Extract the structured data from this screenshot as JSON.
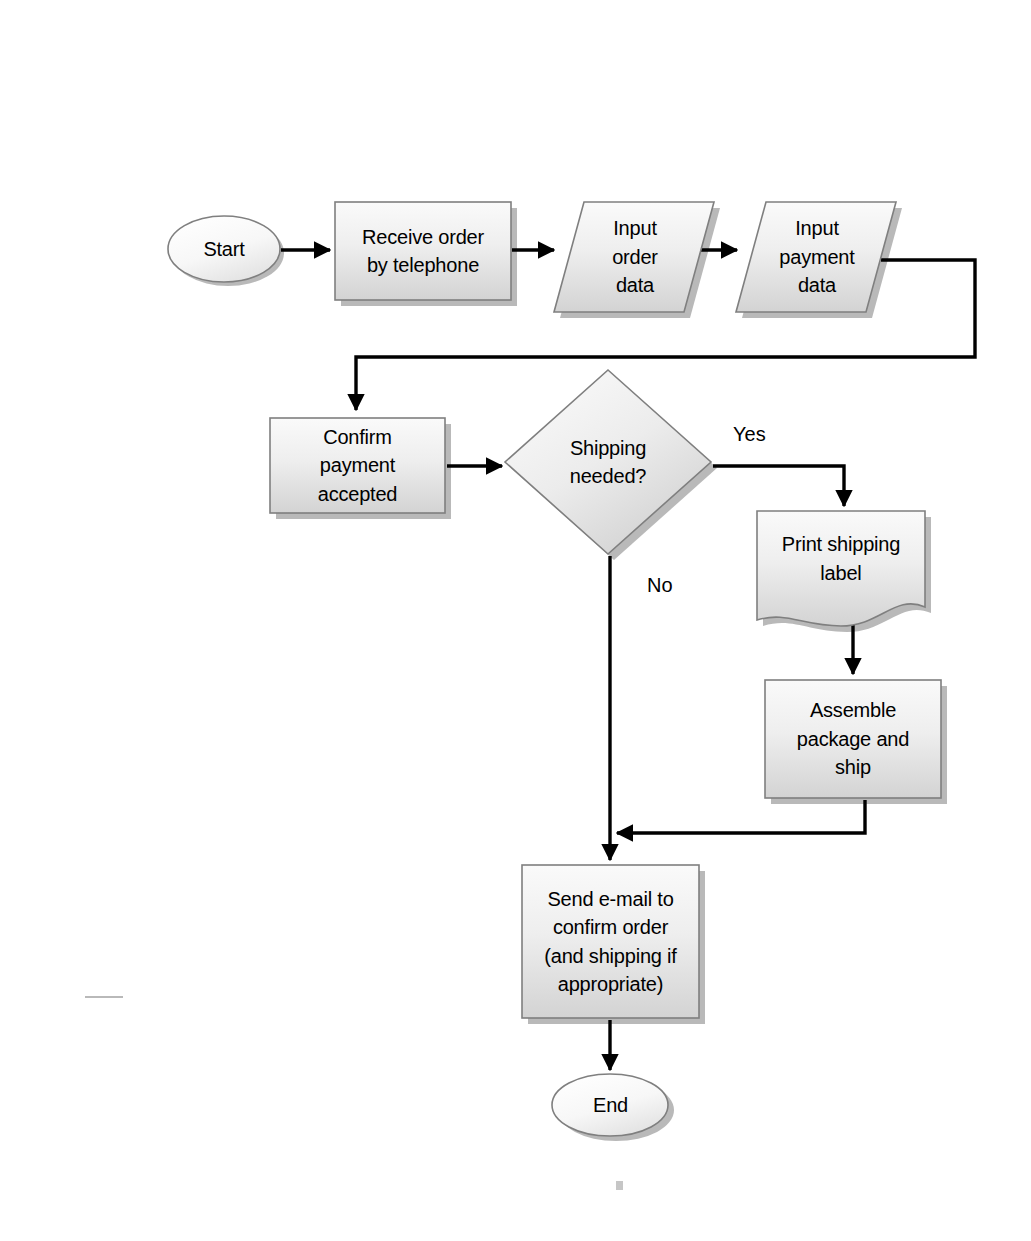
{
  "diagram": {
    "type": "flowchart",
    "background_color": "#ffffff",
    "shape_fill_top": "#f6f6f6",
    "shape_fill_bottom": "#d4d4d4",
    "shape_stroke": "#808080",
    "shadow_color": "#a8a8a8",
    "connector_color": "#000000",
    "text_color": "#000000"
  },
  "nodes": [
    {
      "id": "start",
      "label": "Start",
      "shape": "terminator-oval",
      "x": 168,
      "y": 216,
      "w": 112,
      "h": 66
    },
    {
      "id": "receive_order",
      "label": "Receive order\nby telephone",
      "shape": "process-rectangle",
      "x": 335,
      "y": 202,
      "w": 176,
      "h": 98
    },
    {
      "id": "input_order_data",
      "label": "Input\norder\ndata",
      "shape": "data-parallelogram",
      "x": 556,
      "y": 202,
      "w": 158,
      "h": 110
    },
    {
      "id": "input_payment_data",
      "label": "Input\npayment\ndata",
      "shape": "data-parallelogram",
      "x": 738,
      "y": 202,
      "w": 158,
      "h": 110
    },
    {
      "id": "confirm_payment",
      "label": "Confirm\npayment\naccepted",
      "shape": "process-rectangle",
      "x": 270,
      "y": 418,
      "w": 175,
      "h": 95
    },
    {
      "id": "shipping_needed",
      "label": "Shipping\nneeded?",
      "shape": "decision-diamond",
      "x": 505,
      "y": 370,
      "w": 206,
      "h": 184
    },
    {
      "id": "print_label",
      "label": "Print shipping\nlabel",
      "shape": "document-wave",
      "x": 757,
      "y": 511,
      "w": 168,
      "h": 115
    },
    {
      "id": "assemble_ship",
      "label": "Assemble\npackage and\nship",
      "shape": "process-rectangle",
      "x": 765,
      "y": 680,
      "w": 176,
      "h": 118
    },
    {
      "id": "send_email",
      "label": "Send e-mail to\nconfirm order\n(and shipping if\nappropriate)",
      "shape": "process-rectangle",
      "x": 522,
      "y": 865,
      "w": 177,
      "h": 153
    },
    {
      "id": "end",
      "label": "End",
      "shape": "terminator-oval",
      "x": 553,
      "y": 1075,
      "w": 115,
      "h": 60
    }
  ],
  "edges": [
    {
      "id": "e_start_receive",
      "from": "start",
      "to": "receive_order",
      "label": ""
    },
    {
      "id": "e_receive_order_input",
      "from": "receive_order",
      "to": "input_order_data",
      "label": ""
    },
    {
      "id": "e_input_order_payment",
      "from": "input_order_data",
      "to": "input_payment_data",
      "label": ""
    },
    {
      "id": "e_payment_confirm",
      "from": "input_payment_data",
      "to": "confirm_payment",
      "label": ""
    },
    {
      "id": "e_confirm_decision",
      "from": "confirm_payment",
      "to": "shipping_needed",
      "label": ""
    },
    {
      "id": "e_decision_print",
      "from": "shipping_needed",
      "to": "print_label",
      "label": "Yes"
    },
    {
      "id": "e_decision_email",
      "from": "shipping_needed",
      "to": "send_email",
      "label": "No"
    },
    {
      "id": "e_print_assemble",
      "from": "print_label",
      "to": "assemble_ship",
      "label": ""
    },
    {
      "id": "e_assemble_email",
      "from": "assemble_ship",
      "to": "send_email",
      "label": ""
    },
    {
      "id": "e_email_end",
      "from": "send_email",
      "to": "end",
      "label": ""
    }
  ],
  "edge_labels": {
    "yes": {
      "text": "Yes",
      "x": 733,
      "y": 424
    },
    "no": {
      "text": "No",
      "x": 647,
      "y": 575
    }
  }
}
